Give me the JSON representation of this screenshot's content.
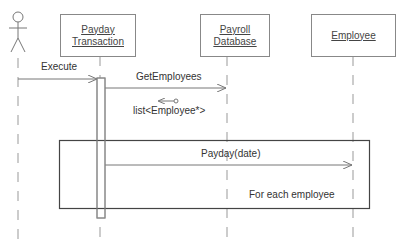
{
  "diagram": {
    "type": "UML sequence diagram",
    "actor": {
      "name": ""
    },
    "objects": [
      {
        "line1": "Payday",
        "line2": "Transaction"
      },
      {
        "line1": "Payroll",
        "line2": "Database"
      },
      {
        "line1": "Employee",
        "line2": ""
      }
    ],
    "messages": [
      {
        "label": "Execute",
        "from": "actor",
        "to": "Payday Transaction"
      },
      {
        "label": "GetEmployees",
        "from": "Payday Transaction",
        "to": "Payroll Database"
      },
      {
        "label": "list<Employee*>",
        "from": "Payroll Database",
        "to": "Payday Transaction",
        "kind": "return"
      },
      {
        "label": "Payday(date)",
        "from": "Payday Transaction",
        "to": "Employee"
      }
    ],
    "loop": {
      "label": "For each employee"
    }
  }
}
